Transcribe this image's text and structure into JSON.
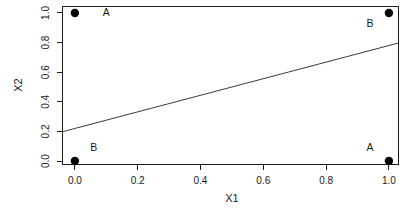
{
  "chart_data": {
    "type": "scatter",
    "title": "",
    "xlabel": "X1",
    "ylabel": "X2",
    "xlim": [
      -0.041,
      1.029
    ],
    "ylim": [
      -0.02,
      1.047
    ],
    "x_ticks": [
      0,
      0.2,
      0.4,
      0.6,
      0.8,
      1
    ],
    "x_tick_labels": [
      "0.0",
      "0.2",
      "0.4",
      "0.6",
      "0.8",
      "1.0"
    ],
    "y_ticks": [
      0,
      0.2,
      0.4,
      0.6,
      0.8,
      1
    ],
    "y_tick_labels": [
      "0.0",
      "0.2",
      "0.4",
      "0.6",
      "0.8",
      "1.0"
    ],
    "grid": false,
    "legend": null,
    "points": [
      {
        "x": 0,
        "y": 1,
        "class": "A"
      },
      {
        "x": 1,
        "y": 1,
        "class": "B"
      },
      {
        "x": 0,
        "y": 0,
        "class": "B"
      },
      {
        "x": 1,
        "y": 0,
        "class": "A"
      }
    ],
    "point_labels": [
      {
        "text": "A",
        "x": 0.1,
        "y": 1.0
      },
      {
        "text": "B",
        "x": 0.94,
        "y": 0.93
      },
      {
        "text": "B",
        "x": 0.06,
        "y": 0.09
      },
      {
        "text": "A",
        "x": 0.94,
        "y": 0.09
      }
    ],
    "line": {
      "kind": "abline",
      "intercept": 0.22,
      "slope": 0.56
    },
    "marker": {
      "shape": "filled-circle",
      "radius": 4.2,
      "color": "#000000"
    },
    "colors": {
      "axis": "#1a1a1a",
      "line": "#3a3a3a",
      "text": "#1a1a1a",
      "background": "#ffffff"
    }
  }
}
